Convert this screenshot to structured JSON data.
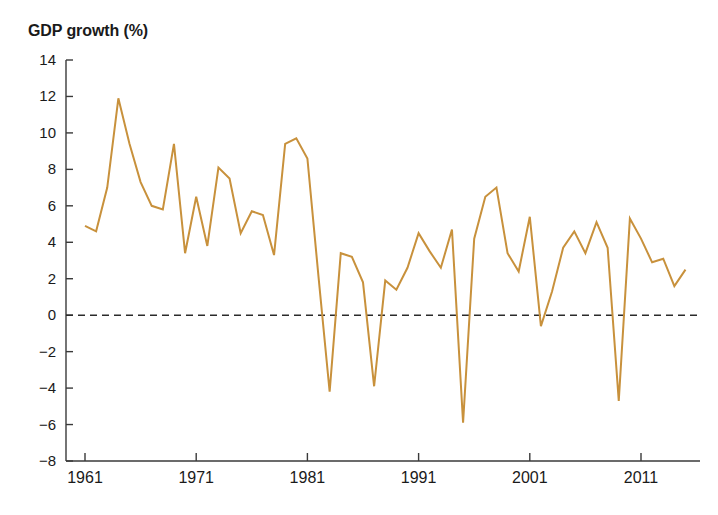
{
  "chart_data": {
    "type": "line",
    "title": "GDP growth (%)",
    "xlabel": "",
    "ylabel": "",
    "ylim": [
      -8,
      14
    ],
    "xlim": [
      1961,
      2015
    ],
    "ytick_values": [
      14,
      12,
      10,
      8,
      6,
      4,
      2,
      0,
      -2,
      -4,
      -6,
      -8
    ],
    "ytick_labels": [
      "14",
      "12",
      "10",
      "8",
      "6",
      "4",
      "2",
      "0",
      "−2",
      "−4",
      "−6",
      "−8"
    ],
    "xtick_values": [
      1961,
      1971,
      1981,
      1991,
      2001,
      2011
    ],
    "xtick_labels": [
      "1961",
      "1971",
      "1981",
      "1991",
      "2001",
      "2011"
    ],
    "grid": false,
    "legend": false,
    "zero_reference_line": 0,
    "line_color": "#C8913C",
    "series": [
      {
        "name": "GDP growth",
        "x": [
          1961,
          1962,
          1963,
          1964,
          1965,
          1966,
          1967,
          1968,
          1969,
          1970,
          1971,
          1972,
          1973,
          1974,
          1975,
          1976,
          1977,
          1978,
          1979,
          1980,
          1981,
          1982,
          1983,
          1984,
          1985,
          1986,
          1987,
          1988,
          1989,
          1990,
          1991,
          1992,
          1993,
          1994,
          1995,
          1996,
          1997,
          1998,
          1999,
          2000,
          2001,
          2002,
          2003,
          2004,
          2005,
          2006,
          2007,
          2008,
          2009,
          2010,
          2011,
          2012,
          2013,
          2014,
          2015
        ],
        "values": [
          4.9,
          4.6,
          7.0,
          11.9,
          9.4,
          7.3,
          6.0,
          5.8,
          9.4,
          3.4,
          6.5,
          3.8,
          8.1,
          7.5,
          4.5,
          5.7,
          5.5,
          3.3,
          9.4,
          9.7,
          8.6,
          2.1,
          -4.2,
          3.4,
          3.2,
          1.8,
          -3.9,
          1.9,
          1.4,
          2.6,
          4.5,
          3.5,
          2.6,
          4.7,
          -5.9,
          4.2,
          6.5,
          7.0,
          3.4,
          2.4,
          5.4,
          -0.6,
          1.3,
          3.7,
          4.6,
          3.4,
          5.1,
          3.7,
          -4.7,
          5.3,
          4.2,
          2.9,
          3.1,
          1.6,
          2.5
        ]
      }
    ]
  },
  "axes": {
    "title": "GDP growth (%)"
  }
}
